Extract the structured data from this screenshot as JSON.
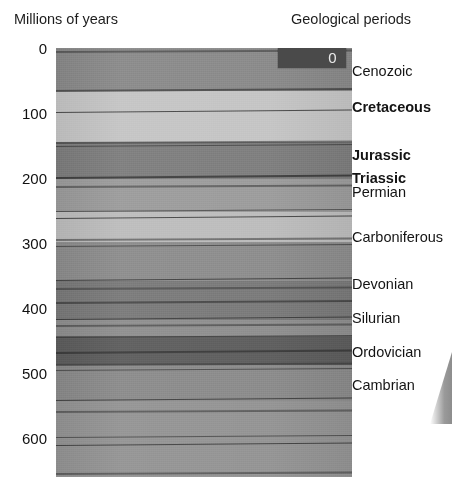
{
  "headers": {
    "left": "Millions of years",
    "right": "Geological periods"
  },
  "axis": {
    "unit": "Millions of years",
    "ticks": [
      {
        "value": "0",
        "myr": 0
      },
      {
        "value": "100",
        "myr": 100
      },
      {
        "value": "200",
        "myr": 200
      },
      {
        "value": "300",
        "myr": 300
      },
      {
        "value": "400",
        "myr": 400
      },
      {
        "value": "500",
        "myr": 500
      },
      {
        "value": "600",
        "myr": 600
      }
    ],
    "range_myr": [
      0,
      660
    ]
  },
  "overlay_box": {
    "label": "0",
    "box_color": "#4a4a4a",
    "text_color": "#eaeaea"
  },
  "periods": [
    {
      "name": "Cenozoic",
      "bold": false,
      "myr": 35
    },
    {
      "name": "Cretaceous",
      "bold": true,
      "myr": 90
    },
    {
      "name": "Jurassic",
      "bold": true,
      "myr": 165
    },
    {
      "name": "Triassic",
      "bold": true,
      "myr": 200
    },
    {
      "name": "Permian",
      "bold": false,
      "myr": 222
    },
    {
      "name": "Carboniferous",
      "bold": false,
      "myr": 290
    },
    {
      "name": "Devonian",
      "bold": false,
      "myr": 363
    },
    {
      "name": "Silurian",
      "bold": false,
      "myr": 415
    },
    {
      "name": "Ordovician",
      "bold": false,
      "myr": 468
    },
    {
      "name": "Cambrian",
      "bold": false,
      "myr": 518
    }
  ],
  "chart_data": {
    "type": "bar",
    "title": "Geological periods",
    "xlabel": "",
    "ylabel": "Millions of years",
    "ylim": [
      0,
      660
    ],
    "orientation": "vertical-stratigraphic-column",
    "grid": false,
    "legend": "right",
    "categories": [
      "Cenozoic",
      "Cretaceous",
      "Jurassic",
      "Triassic",
      "Permian",
      "Carboniferous",
      "Devonian",
      "Silurian",
      "Ordovician",
      "Cambrian"
    ],
    "values": [
      66,
      79,
      56,
      51,
      47,
      60,
      60,
      24,
      45,
      55
    ],
    "bands": [
      {
        "name": "Cenozoic",
        "top_myr": 0,
        "bottom_myr": 66,
        "color": "#8a8a8a"
      },
      {
        "name": "Cretaceous",
        "top_myr": 66,
        "bottom_myr": 145,
        "color": "#c5c5c5"
      },
      {
        "name": "Jurassic",
        "top_myr": 145,
        "bottom_myr": 201,
        "color": "#7e7e7e"
      },
      {
        "name": "Triassic",
        "top_myr": 201,
        "bottom_myr": 252,
        "color": "#9c9c9c"
      },
      {
        "name": "Permian",
        "top_myr": 252,
        "bottom_myr": 299,
        "color": "#bdbdbd"
      },
      {
        "name": "Carboniferous",
        "top_myr": 299,
        "bottom_myr": 359,
        "color": "#8d8d8d"
      },
      {
        "name": "Devonian",
        "top_myr": 359,
        "bottom_myr": 419,
        "color": "#7a7a7a"
      },
      {
        "name": "Silurian",
        "top_myr": 419,
        "bottom_myr": 443,
        "color": "#8f8f8f"
      },
      {
        "name": "Ordovician",
        "top_myr": 443,
        "bottom_myr": 488,
        "color": "#5e5e5e"
      },
      {
        "name": "Cambrian",
        "top_myr": 488,
        "bottom_myr": 543,
        "color": "#8b8b8b"
      },
      {
        "name": "Precambrian",
        "top_myr": 543,
        "bottom_myr": 660,
        "color": "#949494"
      }
    ],
    "strata_lines_myr": [
      6,
      66,
      100,
      146,
      152,
      200,
      213,
      252,
      262,
      296,
      305,
      358,
      370,
      392,
      418,
      428,
      446,
      470,
      488,
      497,
      543,
      560,
      600,
      612,
      655
    ]
  },
  "colors": {
    "background": "#ffffff",
    "text": "#141414",
    "column_base": "#8e8e8e",
    "stratum_line": "#4d4d4d"
  }
}
